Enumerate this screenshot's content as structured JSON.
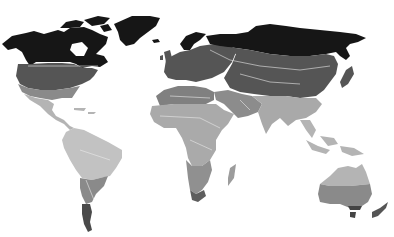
{
  "map": {
    "type": "world-choropleth",
    "projection": "equirectangular-like",
    "style": "grayscale latitude bands",
    "colors": {
      "background": "#ffffff",
      "band_polar": "#161616",
      "band_cold_temperate": "#555555",
      "band_warm_temperate": "#7c7c7c",
      "band_subtropical": "#9c9c9c",
      "band_tropical": "#b4b4b4",
      "band_equatorial": "#c2c2c2",
      "border": "#e8e8e8"
    },
    "regions": [
      {
        "name": "north-america",
        "bands": [
          "polar",
          "cold-temperate",
          "warm-temperate",
          "tropical"
        ]
      },
      {
        "name": "greenland",
        "bands": [
          "polar"
        ]
      },
      {
        "name": "south-america",
        "bands": [
          "equatorial",
          "subtropical",
          "cold-temperate",
          "polar-tip"
        ]
      },
      {
        "name": "europe",
        "bands": [
          "polar",
          "cold-temperate"
        ]
      },
      {
        "name": "africa",
        "bands": [
          "warm-temperate",
          "subtropical",
          "tropical",
          "cold-temperate-tip"
        ]
      },
      {
        "name": "asia",
        "bands": [
          "polar",
          "cold-temperate",
          "subtropical",
          "tropical"
        ]
      },
      {
        "name": "australia",
        "bands": [
          "tropical",
          "warm-temperate",
          "cold-temperate-tip"
        ]
      },
      {
        "name": "new-zealand",
        "bands": [
          "cold-temperate"
        ]
      }
    ]
  }
}
